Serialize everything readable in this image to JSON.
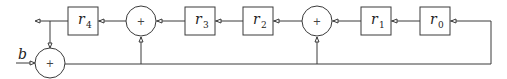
{
  "diagram": {
    "type": "block-diagram",
    "input_label": "b",
    "registers": [
      {
        "id": "r0",
        "name": "r",
        "sub": "0"
      },
      {
        "id": "r1",
        "name": "r",
        "sub": "1"
      },
      {
        "id": "r2",
        "name": "r",
        "sub": "2"
      },
      {
        "id": "r3",
        "name": "r",
        "sub": "3"
      },
      {
        "id": "r4",
        "name": "r",
        "sub": "4"
      }
    ],
    "adders": [
      {
        "id": "adder-input",
        "symbol": "+"
      },
      {
        "id": "adder-1",
        "symbol": "+"
      },
      {
        "id": "adder-2",
        "symbol": "+"
      }
    ]
  }
}
